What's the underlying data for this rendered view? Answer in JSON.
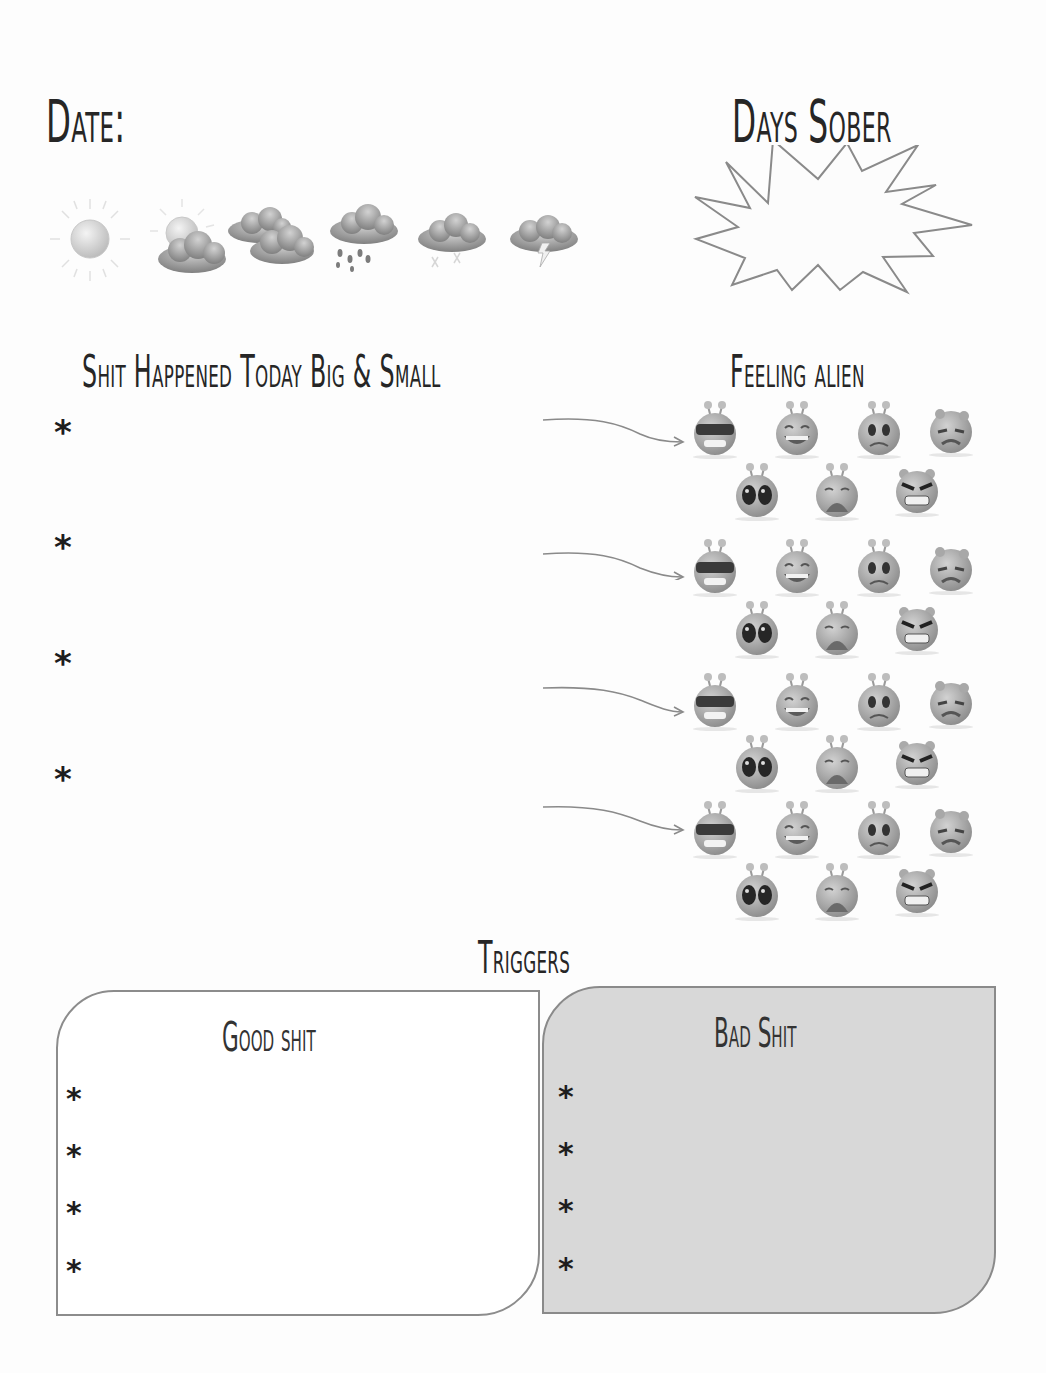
{
  "header": {
    "date_label": "Date:",
    "days_sober_label": "Days Sober",
    "days_sober_value": ""
  },
  "weather": {
    "options": [
      {
        "icon": "sun-icon",
        "label": "Sunny"
      },
      {
        "icon": "partly-cloudy-icon",
        "label": "Partly cloudy"
      },
      {
        "icon": "cloudy-icon",
        "label": "Cloudy"
      },
      {
        "icon": "rain-icon",
        "label": "Rain"
      },
      {
        "icon": "snow-icon",
        "label": "Snow"
      },
      {
        "icon": "thunderstorm-icon",
        "label": "Thunderstorm"
      }
    ]
  },
  "events": {
    "heading": "Shit Happened Today Big & Small",
    "bullet_glyph": "*",
    "items": [
      {
        "text": ""
      },
      {
        "text": ""
      },
      {
        "text": ""
      },
      {
        "text": ""
      }
    ]
  },
  "feelings": {
    "heading": "Feeling alien",
    "moods": [
      {
        "icon": "alien-cool-sunglasses-icon",
        "label": "Cool"
      },
      {
        "icon": "alien-laughing-icon",
        "label": "Laughing"
      },
      {
        "icon": "alien-worried-icon",
        "label": "Worried"
      },
      {
        "icon": "alien-sad-icon",
        "label": "Sad"
      },
      {
        "icon": "alien-shocked-icon",
        "label": "Shocked"
      },
      {
        "icon": "alien-crying-icon",
        "label": "Crying"
      },
      {
        "icon": "alien-angry-icon",
        "label": "Angry"
      }
    ]
  },
  "triggers": {
    "heading": "Triggers",
    "good": {
      "title": "Good shit",
      "bullet_glyph": "*",
      "items": [
        {
          "text": ""
        },
        {
          "text": ""
        },
        {
          "text": ""
        },
        {
          "text": ""
        }
      ]
    },
    "bad": {
      "title": "Bad Shit",
      "bullet_glyph": "*",
      "items": [
        {
          "text": ""
        },
        {
          "text": ""
        },
        {
          "text": ""
        },
        {
          "text": ""
        }
      ]
    }
  },
  "colors": {
    "ink": "#262626",
    "outline": "#8c8c8c",
    "bad_box_fill": "#d8d8d8",
    "page": "#fdfdfd"
  }
}
